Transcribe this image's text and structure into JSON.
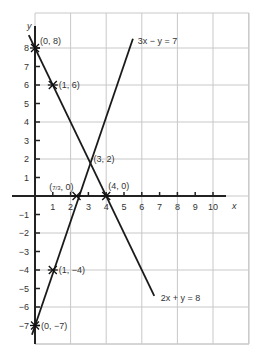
{
  "chart_data": {
    "type": "line",
    "title": "",
    "xlabel": "x",
    "ylabel": "y",
    "xlim": [
      0,
      11.9
    ],
    "ylim": [
      -8,
      9.7
    ],
    "grid": true,
    "grid_step": 2,
    "x_ticks": [
      1,
      2,
      3,
      4,
      5,
      6,
      7,
      8,
      9,
      10
    ],
    "y_ticks": [
      8,
      7,
      6,
      5,
      4,
      3,
      2,
      1,
      -1,
      -2,
      -3,
      -4,
      -5,
      -6,
      -7
    ],
    "series": [
      {
        "name": "3x − y = 7",
        "equation": "3x - y = 7",
        "x": [
          -0.17,
          5.5
        ],
        "y": [
          -7.5,
          8.5
        ],
        "label_pos": [
          5.6,
          8.4
        ]
      },
      {
        "name": "2x + y = 8",
        "equation": "2x + y = 8",
        "x": [
          -0.35,
          6.7
        ],
        "y": [
          8.7,
          -5.4
        ],
        "label_pos": [
          6.9,
          -5.5
        ]
      }
    ],
    "marked_points": [
      {
        "x": 0,
        "y": 8,
        "label": "(0, 8)",
        "marker": "star"
      },
      {
        "x": 1,
        "y": 6,
        "label": "(1, 6)",
        "marker": "star"
      },
      {
        "x": 3,
        "y": 2,
        "label": "(3, 2)",
        "marker": "none"
      },
      {
        "x": 2.333,
        "y": 0,
        "label": "(7/3, 0)",
        "marker": "star"
      },
      {
        "x": 4,
        "y": 0,
        "label": "(4, 0)",
        "marker": "star"
      },
      {
        "x": 1,
        "y": -4,
        "label": "(1, −4)",
        "marker": "star"
      },
      {
        "x": 0,
        "y": -7,
        "label": "(0, −7)",
        "marker": "star"
      }
    ]
  }
}
